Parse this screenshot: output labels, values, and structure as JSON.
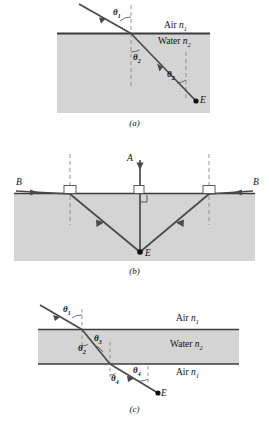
{
  "figure": {
    "type": "optics-refraction-diagram",
    "media": {
      "air": "Air",
      "water": "Water",
      "n1": "n",
      "n1_sub": "1",
      "n2": "n",
      "n2_sub": "2"
    },
    "colors": {
      "water_fill": "#d4d4d4",
      "ray": "#4a4a4a",
      "line": "#3a3a3a",
      "dash": "#8a8a8a"
    }
  },
  "panel_a": {
    "caption": "(a)",
    "label_air": "Air",
    "label_air_n": "n",
    "label_air_sub": "1",
    "label_water": "Water",
    "label_water_n": "n",
    "label_water_sub": "2",
    "angle_incident": "θ",
    "angle_incident_sub": "1",
    "angle_refract_left": "θ",
    "angle_refract_left_sub": "2",
    "angle_refract_right": "θ",
    "angle_refract_right_sub": "2",
    "point_e": "E"
  },
  "panel_b": {
    "caption": "(b)",
    "ray_a": "A",
    "ray_b_left": "B",
    "ray_b_right": "B",
    "point_e": "E"
  },
  "panel_c": {
    "caption": "(c)",
    "label_air_top": "Air",
    "label_air_top_n": "n",
    "label_air_top_sub": "1",
    "label_water": "Water",
    "label_water_n": "n",
    "label_water_sub": "2",
    "label_air_bottom": "Air",
    "label_air_bottom_n": "n",
    "label_air_bottom_sub": "1",
    "angle_1": "θ",
    "angle_1_sub": "1",
    "angle_2": "θ",
    "angle_2_sub": "2",
    "angle_3": "θ",
    "angle_3_sub": "3",
    "angle_4_left": "θ",
    "angle_4_left_sub": "4",
    "angle_4_right": "θ",
    "angle_4_right_sub": "4",
    "point_e": "E"
  }
}
